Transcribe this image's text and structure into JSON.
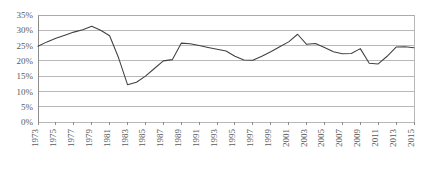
{
  "chart_data": {
    "type": "line",
    "title": "",
    "subtitle": "",
    "xlabel": "",
    "ylabel": "",
    "ylim": [
      0,
      35
    ],
    "ytick_labels": [
      "0%",
      "5%",
      "10%",
      "15%",
      "20%",
      "25%",
      "30%",
      "35%"
    ],
    "ytick_values": [
      0,
      5,
      10,
      15,
      20,
      25,
      30,
      35
    ],
    "grid": true,
    "legend": "none",
    "xlim": [
      1973,
      2015
    ],
    "xtick_labels": [
      "1973",
      "1975",
      "1977",
      "1979",
      "1981",
      "1983",
      "1985",
      "1987",
      "1989",
      "1991",
      "1993",
      "1995",
      "1997",
      "1999",
      "2001",
      "2003",
      "2005",
      "2007",
      "2009",
      "2011",
      "2013",
      "2015"
    ],
    "x": [
      1973,
      1974,
      1975,
      1976,
      1977,
      1978,
      1979,
      1980,
      1981,
      1982,
      1983,
      1984,
      1985,
      1986,
      1987,
      1988,
      1989,
      1990,
      1991,
      1992,
      1993,
      1994,
      1995,
      1996,
      1997,
      1998,
      1999,
      2000,
      2001,
      2002,
      2003,
      2004,
      2005,
      2006,
      2007,
      2008,
      2009,
      2010,
      2011,
      2012,
      2013,
      2014,
      2015
    ],
    "values": [
      24.8,
      26.2,
      27.4,
      28.4,
      29.4,
      30.2,
      31.3,
      30.0,
      28.2,
      21.0,
      12.2,
      13.0,
      15.0,
      17.5,
      20.0,
      20.4,
      25.8,
      25.6,
      25.0,
      24.4,
      23.8,
      23.2,
      21.5,
      20.3,
      20.2,
      21.5,
      23.0,
      24.6,
      26.2,
      28.7,
      25.4,
      25.7,
      24.4,
      23.0,
      22.3,
      22.4,
      24.0,
      19.2,
      19.0,
      21.5,
      24.5,
      24.6,
      24.3
    ],
    "series_name": "percentage",
    "units": "%"
  }
}
